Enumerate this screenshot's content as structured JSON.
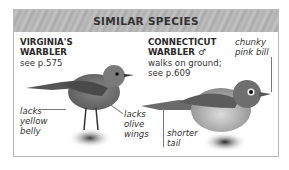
{
  "header": {
    "title": "SIMILAR SPECIES"
  },
  "species": [
    {
      "name_line1": "VIRGINIA'S",
      "name_line2": "WARBLER",
      "note_line1": "see p.575",
      "annotations": [
        {
          "line1": "lacks",
          "line2": "yellow",
          "line3": "belly"
        },
        {
          "line1": "lacks",
          "line2": "olive",
          "line3": "wings"
        }
      ]
    },
    {
      "name_line1": "CONNECTICUT",
      "name_line2": "WARBLER",
      "sex_symbol": "♂",
      "note_line1": "walks on ground;",
      "note_line2": "see p.609",
      "annotations": [
        {
          "line1": "chunky",
          "line2": "pink bill"
        },
        {
          "line1": "shorter",
          "line2": "tail"
        }
      ]
    }
  ],
  "colors": {
    "header_bg": "#b5b5b5",
    "border": "#b9b9b9",
    "text": "#2a2a2a"
  }
}
